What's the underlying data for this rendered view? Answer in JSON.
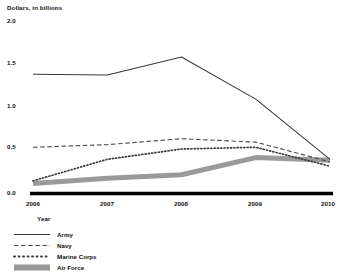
{
  "chart_data": {
    "type": "line",
    "title": "",
    "ylabel": "Dollars, in billions",
    "xlabel": "Year",
    "categories": [
      "2006",
      "2007",
      "2008",
      "2009",
      "2010"
    ],
    "x": [
      2006,
      2007,
      2008,
      2009,
      2010
    ],
    "ylim": [
      0.0,
      2.0
    ],
    "xlim": [
      2006,
      2010
    ],
    "yticks": [
      "2.0",
      "1.5",
      "1.0",
      "0.5",
      "0.0"
    ],
    "ytick_values": [
      2.0,
      1.5,
      1.0,
      0.5,
      0.0
    ],
    "grid": false,
    "legend_position": "below-left",
    "series": [
      {
        "name": "Army",
        "style": "solid",
        "color": "#3a3a3a",
        "values": [
          1.37,
          1.36,
          1.57,
          1.08,
          0.38
        ]
      },
      {
        "name": "Navy",
        "style": "dashed",
        "color": "#4a4a4a",
        "values": [
          0.52,
          0.55,
          0.62,
          0.58,
          0.35
        ]
      },
      {
        "name": "Marine Corps",
        "style": "dotted",
        "color": "#3a3a3a",
        "values": [
          0.13,
          0.38,
          0.5,
          0.52,
          0.3
        ]
      },
      {
        "name": "Air Force",
        "style": "thick-gray",
        "color": "#9a9a9a",
        "values": [
          0.1,
          0.16,
          0.2,
          0.4,
          0.37
        ]
      }
    ]
  },
  "axes": {
    "y_title": "Dollars, in billions",
    "x_title": "Year",
    "y_labels": [
      "2.0",
      "1.5",
      "1.0",
      "0.5",
      "0.0"
    ],
    "x_labels": [
      "2006",
      "2007",
      "2008",
      "2009",
      "2010"
    ]
  },
  "legend": {
    "items": [
      {
        "label": "Army",
        "style": "solid"
      },
      {
        "label": "Navy",
        "style": "dashed"
      },
      {
        "label": "Marine Corps",
        "style": "dotted"
      },
      {
        "label": "Air Force",
        "style": "thick-gray"
      }
    ]
  },
  "colors": {
    "army": "#3a3a3a",
    "navy": "#4a4a4a",
    "marine_corps": "#3a3a3a",
    "air_force": "#9a9a9a",
    "axis": "#000000",
    "background": "#ffffff"
  }
}
